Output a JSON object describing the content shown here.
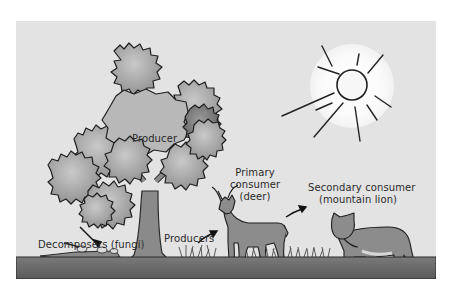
{
  "diagram": {
    "type": "food-chain illustration",
    "background_color": "#e3e3e3",
    "ground_color": "#6e6e6e",
    "sun": {
      "icon": "sun-icon",
      "glow_color": "#ffffff"
    },
    "labels": {
      "producer_tree": "Producer",
      "decomposers_line1": "Decomposers (fungi)",
      "producers_grass": "Producers",
      "primary_line1": "Primary",
      "primary_line2": "consumer",
      "primary_line3": "(deer)",
      "secondary_line1": "Secondary consumer",
      "secondary_line2": "(mountain lion)"
    },
    "nodes": [
      {
        "id": "sun",
        "name": "Sun"
      },
      {
        "id": "tree",
        "name": "Producer"
      },
      {
        "id": "fungi",
        "name": "Decomposers (fungi)"
      },
      {
        "id": "grass",
        "name": "Producers"
      },
      {
        "id": "deer",
        "name": "Primary consumer (deer)"
      },
      {
        "id": "lion",
        "name": "Secondary consumer (mountain lion)"
      }
    ],
    "arrows": [
      {
        "from": "label-decomposers",
        "to": "fungi"
      },
      {
        "from": "grass",
        "to": "deer"
      },
      {
        "from": "deer",
        "to": "lion"
      }
    ]
  }
}
